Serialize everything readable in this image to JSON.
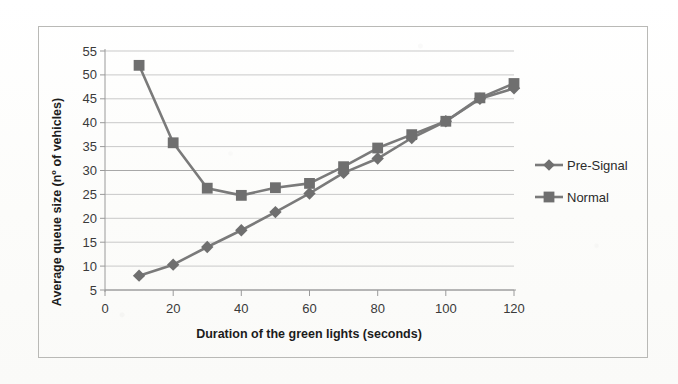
{
  "chart_data": {
    "type": "line",
    "title": "",
    "xlabel": "Duration of the green lights (seconds)",
    "ylabel": "Average queue size (nº of vehicles)",
    "x": [
      10,
      20,
      30,
      40,
      50,
      60,
      70,
      80,
      90,
      100,
      110,
      120
    ],
    "xlim": [
      0,
      120
    ],
    "ylim": [
      5,
      55
    ],
    "xticks": [
      0,
      20,
      40,
      60,
      80,
      100,
      120
    ],
    "yticks": [
      5,
      10,
      15,
      20,
      25,
      30,
      35,
      40,
      45,
      50,
      55
    ],
    "xtick_labels": [
      "0",
      "20",
      "40",
      "60",
      "80",
      "100",
      "120"
    ],
    "ytick_labels": [
      "5",
      "10",
      "15",
      "20",
      "25",
      "30",
      "35",
      "40",
      "45",
      "50",
      "55"
    ],
    "grid": "horizontal",
    "legend_position": "right",
    "series": [
      {
        "name": "Pre-Signal",
        "marker": "diamond",
        "color": "#7a7a7a",
        "values": [
          8.0,
          10.3,
          14.0,
          17.5,
          21.3,
          25.2,
          29.5,
          32.5,
          36.8,
          40.3,
          45.0,
          47.2
        ]
      },
      {
        "name": "Normal",
        "marker": "square",
        "color": "#7a7a7a",
        "values": [
          52.0,
          35.8,
          26.3,
          24.8,
          26.4,
          27.3,
          30.8,
          34.7,
          37.5,
          40.3,
          45.2,
          48.2
        ]
      }
    ]
  },
  "legend": {
    "entries": [
      {
        "label": "Pre-Signal"
      },
      {
        "label": "Normal"
      }
    ]
  },
  "axes": {
    "x_title": "Duration of the green lights (seconds)",
    "y_title": "Average queue size (nº of vehicles)"
  },
  "colors": {
    "series_line": "#7a7a7a",
    "series_marker": "#6f6f6f",
    "gridline": "#c9c9c9",
    "axis": "#9a9a9a",
    "text": "#262626",
    "frame_border": "#b9b9b6",
    "background": "#fdfdfc"
  }
}
